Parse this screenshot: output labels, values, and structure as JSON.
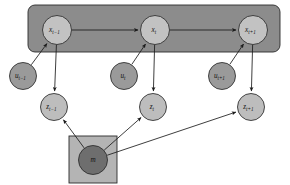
{
  "figure": {
    "type": "probabilistic-graphical-model",
    "background_color": "#ffffff"
  },
  "palette": {
    "plate_dynamics_fill": "#8c8c8c",
    "plate_map_fill": "#b4b4b4",
    "state_node_fill": "#c2c2c2",
    "control_node_fill": "#9a9a9a",
    "measurement_node_fill": "#bdbdbd",
    "map_node_fill": "#6e6e6e",
    "node_stroke": "#2a2a2a",
    "edge_color": "#1b1b1b",
    "label_color": "#111111"
  },
  "plates": [
    {
      "id": "dynamics-plate",
      "name": "state-chain-plate",
      "shape": "rounded-rect",
      "x": 28,
      "y": 5,
      "width": 252,
      "height": 47,
      "radius": 7,
      "fill": "#8c8c8c"
    },
    {
      "id": "map-plate",
      "name": "map-plate",
      "shape": "rect",
      "x": 69,
      "y": 136,
      "width": 48,
      "height": 47,
      "radius": 0,
      "fill": "#b4b4b4"
    }
  ],
  "nodes": [
    {
      "id": "x_tm1",
      "name": "state-node-x-t-minus-1",
      "base": "x",
      "sub": "t−1",
      "cx": 57,
      "cy": 30,
      "r": 14.5,
      "fill": "#c2c2c2",
      "row": "state"
    },
    {
      "id": "x_t",
      "name": "state-node-x-t",
      "base": "x",
      "sub": "t",
      "cx": 155,
      "cy": 30,
      "r": 14.5,
      "fill": "#c2c2c2",
      "row": "state"
    },
    {
      "id": "x_tp1",
      "name": "state-node-x-t-plus-1",
      "base": "x",
      "sub": "t+1",
      "cx": 253,
      "cy": 30,
      "r": 14.5,
      "fill": "#c2c2c2",
      "row": "state"
    },
    {
      "id": "u_tm1",
      "name": "control-node-u-t-minus-1",
      "base": "u",
      "sub": "t−1",
      "cx": 23,
      "cy": 76,
      "r": 13.5,
      "fill": "#9a9a9a",
      "row": "control"
    },
    {
      "id": "u_t",
      "name": "control-node-u-t",
      "base": "u",
      "sub": "t",
      "cx": 124,
      "cy": 76,
      "r": 13.5,
      "fill": "#9a9a9a",
      "row": "control"
    },
    {
      "id": "u_tp1",
      "name": "control-node-u-t-plus-1",
      "base": "u",
      "sub": "t+1",
      "cx": 222,
      "cy": 76,
      "r": 13.5,
      "fill": "#9a9a9a",
      "row": "control"
    },
    {
      "id": "z_tm1",
      "name": "measurement-node-z-t-minus-1",
      "base": "z",
      "sub": "t−1",
      "cx": 54,
      "cy": 107,
      "r": 13.5,
      "fill": "#bdbdbd",
      "row": "measurement"
    },
    {
      "id": "z_t",
      "name": "measurement-node-z-t",
      "base": "z",
      "sub": "t",
      "cx": 153,
      "cy": 107,
      "r": 13.5,
      "fill": "#bdbdbd",
      "row": "measurement"
    },
    {
      "id": "z_tp1",
      "name": "measurement-node-z-t-plus-1",
      "base": "z",
      "sub": "t+1",
      "cx": 251,
      "cy": 107,
      "r": 13.5,
      "fill": "#bdbdbd",
      "row": "measurement"
    },
    {
      "id": "m",
      "name": "map-node-m",
      "base": "m",
      "sub": "",
      "cx": 93,
      "cy": 160,
      "r": 14.5,
      "fill": "#6e6e6e",
      "row": "map"
    }
  ],
  "edges": [
    {
      "id": "e1",
      "name": "edge-x-t-minus-1-to-x-t",
      "from": "x_tm1",
      "to": "x_t",
      "arrow": true
    },
    {
      "id": "e2",
      "name": "edge-x-t-to-x-t-plus-1",
      "from": "x_t",
      "to": "x_tp1",
      "arrow": true
    },
    {
      "id": "e3",
      "name": "edge-u-t-minus-1-to-x-t-minus-1",
      "from": "u_tm1",
      "to": "x_tm1",
      "arrow": true
    },
    {
      "id": "e4",
      "name": "edge-u-t-to-x-t",
      "from": "u_t",
      "to": "x_t",
      "arrow": true
    },
    {
      "id": "e5",
      "name": "edge-u-t-plus-1-to-x-t-plus-1",
      "from": "u_tp1",
      "to": "x_tp1",
      "arrow": true
    },
    {
      "id": "e6",
      "name": "edge-x-t-minus-1-to-z-t-minus-1",
      "from": "x_tm1",
      "to": "z_tm1",
      "arrow": true
    },
    {
      "id": "e7",
      "name": "edge-x-t-to-z-t",
      "from": "x_t",
      "to": "z_t",
      "arrow": true
    },
    {
      "id": "e8",
      "name": "edge-x-t-plus-1-to-z-t-plus-1",
      "from": "x_tp1",
      "to": "z_tp1",
      "arrow": true
    },
    {
      "id": "e9",
      "name": "edge-m-to-z-t-minus-1",
      "from": "m",
      "to": "z_tm1",
      "arrow": true
    },
    {
      "id": "e10",
      "name": "edge-m-to-z-t",
      "from": "m",
      "to": "z_t",
      "arrow": true
    },
    {
      "id": "e11",
      "name": "edge-m-to-z-t-plus-1",
      "from": "m",
      "to": "z_tp1",
      "arrow": true
    }
  ]
}
